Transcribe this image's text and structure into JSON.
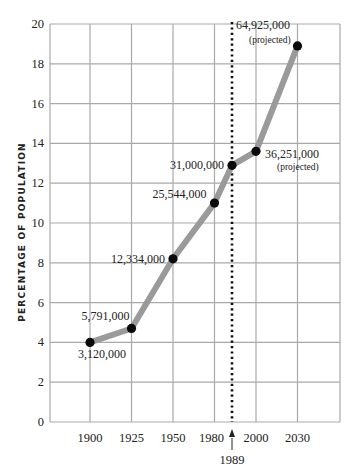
{
  "chart_data": {
    "type": "line",
    "title": "",
    "xlabel": "",
    "ylabel": "PERCENTAGE OF POPULATION",
    "ylim": [
      0,
      20
    ],
    "yticks": [
      0,
      2,
      4,
      6,
      8,
      10,
      12,
      14,
      16,
      18,
      20
    ],
    "xticks": [
      "1900",
      "1925",
      "1950",
      "1980",
      "2000",
      "2030"
    ],
    "grid": true,
    "legend": null,
    "series": [
      {
        "name": "Population percentage",
        "x": [
          1900,
          1925,
          1950,
          1980,
          1989,
          2000,
          2030
        ],
        "values": [
          4.0,
          4.7,
          8.2,
          11.0,
          12.9,
          13.6,
          18.9
        ],
        "point_labels": [
          "3,120,000",
          "5,791,000",
          "12,334,000",
          "25,544,000",
          "31,000,000",
          "36,251,000",
          "64,925,000"
        ],
        "point_notes": [
          "",
          "",
          "",
          "",
          "",
          "(projected)",
          "(projected)"
        ]
      }
    ],
    "annotations": [
      {
        "type": "vertical-dotted-line",
        "x": 1989,
        "label": "1989"
      }
    ]
  }
}
